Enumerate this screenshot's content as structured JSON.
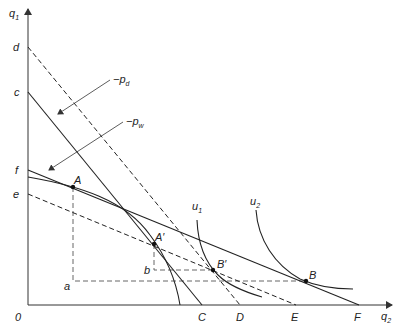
{
  "axes": {
    "y_label": "q",
    "y_label_sub": "1",
    "x_label": "q",
    "x_label_sub": "2",
    "origin_label": "0"
  },
  "y_intercepts": {
    "d": "d",
    "c": "c",
    "f": "f",
    "e": "e"
  },
  "x_intercepts": {
    "C": "C",
    "D": "D",
    "E": "E",
    "F": "F"
  },
  "points": {
    "A": "A",
    "A_prime": "A′",
    "B": "B",
    "B_prime": "B′"
  },
  "guide_levels": {
    "a": "a",
    "b": "b"
  },
  "price_labels": {
    "pd_prefix": "−p",
    "pd_sub": "d",
    "pw_prefix": "−p",
    "pw_sub": "w"
  },
  "indifference_curves": {
    "u1": "u",
    "u1_sub": "1",
    "u2": "u",
    "u2_sub": "2"
  },
  "colors": {
    "line": "#222222",
    "background": "#ffffff"
  }
}
